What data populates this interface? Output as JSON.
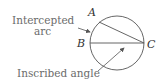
{
  "diagram": {
    "labels": {
      "intercepted_line1": "Intercepted",
      "intercepted_line2": "arc",
      "inscribed": "Inscribed angle"
    },
    "points": {
      "A": "A",
      "B": "B",
      "C": "C"
    },
    "colors": {
      "stroke": "#555555",
      "label": "#6b6b6b",
      "point_label": "#333333"
    }
  }
}
